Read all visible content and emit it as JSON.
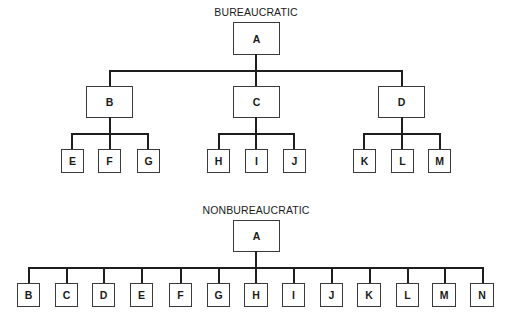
{
  "bureaucratic": {
    "title": "BUREAUCRATIC",
    "root": {
      "label": "A"
    },
    "level1": [
      {
        "label": "B",
        "children": [
          "E",
          "F",
          "G"
        ]
      },
      {
        "label": "C",
        "children": [
          "H",
          "I",
          "J"
        ]
      },
      {
        "label": "D",
        "children": [
          "K",
          "L",
          "M"
        ]
      }
    ]
  },
  "nonbureaucratic": {
    "title": "NONBUREAUCRATIC",
    "root": {
      "label": "A"
    },
    "children": [
      "B",
      "C",
      "D",
      "E",
      "F",
      "G",
      "H",
      "I",
      "J",
      "K",
      "L",
      "M",
      "N"
    ]
  },
  "colors": {
    "line": "#1e1e1e",
    "box_border": "#3a3a3a",
    "background": "#ffffff"
  }
}
